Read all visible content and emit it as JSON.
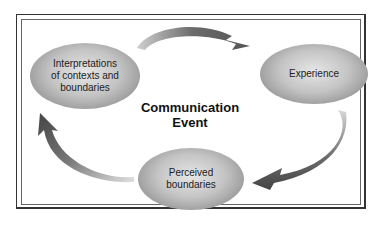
{
  "diagram": {
    "center_label": [
      "Communication",
      "Event"
    ],
    "nodes": [
      {
        "id": "interpretations",
        "lines": [
          "Interpretations",
          "of contexts and",
          "boundaries"
        ]
      },
      {
        "id": "experience",
        "lines": [
          "Experience"
        ]
      },
      {
        "id": "perceived",
        "lines": [
          "Perceived",
          "boundaries"
        ]
      }
    ],
    "arrows": [
      {
        "from": "interpretations",
        "to": "experience",
        "icon": "curved-arrow-icon"
      },
      {
        "from": "experience",
        "to": "perceived",
        "icon": "curved-arrow-icon"
      },
      {
        "from": "perceived",
        "to": "interpretations",
        "icon": "curved-arrow-icon"
      }
    ]
  }
}
